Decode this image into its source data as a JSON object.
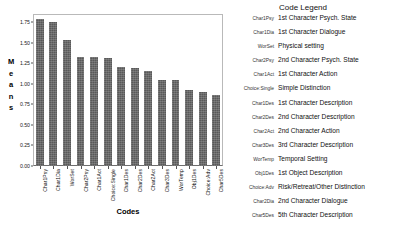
{
  "chart_data": {
    "type": "bar",
    "title": "",
    "xlabel": "Codes",
    "ylabel": "Means",
    "ylim": [
      0,
      1.85
    ],
    "yticks": [
      "0.00",
      "0.25",
      "0.50",
      "0.75",
      "1.00",
      "1.25",
      "1.50",
      "1.75"
    ],
    "ytick_values": [
      0,
      0.25,
      0.5,
      0.75,
      1.0,
      1.25,
      1.5,
      1.75
    ],
    "grid": false,
    "legend_position": "right",
    "bar_color": "#595959",
    "categories": [
      "Char1Psy",
      "Char1Dia",
      "WorSet",
      "Char2Psy",
      "Char1Act",
      "Choice:Single",
      "Char1Des",
      "Char2Des",
      "Char2Act",
      "Char3Des",
      "WorTemp",
      "Obj1Des",
      "Choice:Adv",
      "Char5Des"
    ],
    "values": [
      1.79,
      1.75,
      1.53,
      1.33,
      1.33,
      1.32,
      1.2,
      1.19,
      1.16,
      1.05,
      1.05,
      0.93,
      0.9,
      0.86
    ]
  },
  "ylabel_letters": [
    "M",
    "e",
    "a",
    "n",
    "s"
  ],
  "legend": {
    "title": "Code Legend",
    "rows": [
      {
        "code": "Char1Psy",
        "desc": "1st Character Psych. State"
      },
      {
        "code": "Char1Dia",
        "desc": "1st Character Dialogue"
      },
      {
        "code": "WorSet",
        "desc": "Physical setting"
      },
      {
        "code": "Char2Psy",
        "desc": "2nd Character Psych. State"
      },
      {
        "code": "Char1Act",
        "desc": "1st Character Action"
      },
      {
        "code": "Choice:Single",
        "desc": "Simple Distinction"
      },
      {
        "code": "Char1Des",
        "desc": "1st Character Description"
      },
      {
        "code": "Char2Des",
        "desc": "2nd Character Description"
      },
      {
        "code": "Char2Act",
        "desc": "2nd Character Action"
      },
      {
        "code": "Char3Des",
        "desc": "3rd Character Description"
      },
      {
        "code": "WorTemp",
        "desc": "Temporal Setting"
      },
      {
        "code": "Obj1Des",
        "desc": "1st Object Description"
      },
      {
        "code": "Choice:Adv",
        "desc": "Risk/Retreat/Other Distinction"
      },
      {
        "code": "Char2Dia",
        "desc": "2nd Character Dialogue"
      },
      {
        "code": "Char5Des",
        "desc": "5th Character Description"
      }
    ]
  },
  "caption": ""
}
